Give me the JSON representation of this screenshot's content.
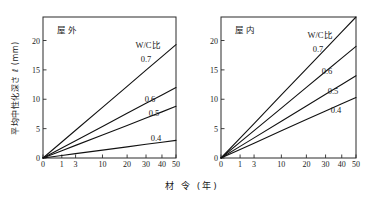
{
  "figure": {
    "axis_title_x": "材 令 (年)",
    "axis_title_y": "平均中性化深さ ℓ (mm)",
    "legend_title": "W/C比"
  },
  "chart_data": [
    {
      "type": "line",
      "title": "屋外",
      "xlabel": "材 令 (年)",
      "ylabel": "平均中性化深さ ℓ (mm)",
      "x_scale": "sqrt",
      "xlim": [
        0,
        50
      ],
      "ylim": [
        0,
        24
      ],
      "xticks": [
        0,
        1,
        3,
        10,
        20,
        30,
        40,
        50
      ],
      "xticklabels": [
        "0",
        "1",
        "3",
        "10",
        "20",
        "30",
        "40",
        "50"
      ],
      "yticks": [
        0,
        5,
        10,
        15,
        20
      ],
      "yticklabels": [
        "0",
        "5",
        "10",
        "15",
        "20"
      ],
      "grid": false,
      "legend_title": "W/C比",
      "legend_position": "inline-right",
      "series": [
        {
          "name": "0.7",
          "label": "0.7",
          "values": [
            {
              "x": 0,
              "y": 0
            },
            {
              "x": 1,
              "y": 2.73
            },
            {
              "x": 3,
              "y": 4.73
            },
            {
              "x": 10,
              "y": 8.63
            },
            {
              "x": 20,
              "y": 12.2
            },
            {
              "x": 30,
              "y": 14.95
            },
            {
              "x": 40,
              "y": 17.26
            },
            {
              "x": 50,
              "y": 19.3
            }
          ]
        },
        {
          "name": "0.6",
          "label": "0.6",
          "values": [
            {
              "x": 0,
              "y": 0
            },
            {
              "x": 1,
              "y": 1.7
            },
            {
              "x": 3,
              "y": 2.94
            },
            {
              "x": 10,
              "y": 5.37
            },
            {
              "x": 20,
              "y": 7.6
            },
            {
              "x": 30,
              "y": 9.3
            },
            {
              "x": 40,
              "y": 10.74
            },
            {
              "x": 50,
              "y": 12.0
            }
          ]
        },
        {
          "name": "0.5",
          "label": "0.5",
          "values": [
            {
              "x": 0,
              "y": 0
            },
            {
              "x": 1,
              "y": 1.24
            },
            {
              "x": 3,
              "y": 2.15
            },
            {
              "x": 10,
              "y": 3.93
            },
            {
              "x": 20,
              "y": 5.55
            },
            {
              "x": 30,
              "y": 6.8
            },
            {
              "x": 40,
              "y": 7.85
            },
            {
              "x": 50,
              "y": 8.8
            }
          ]
        },
        {
          "name": "0.4",
          "label": "0.4",
          "values": [
            {
              "x": 0,
              "y": 0
            },
            {
              "x": 1,
              "y": 0.42
            },
            {
              "x": 3,
              "y": 0.74
            },
            {
              "x": 10,
              "y": 1.34
            },
            {
              "x": 20,
              "y": 1.9
            },
            {
              "x": 30,
              "y": 2.33
            },
            {
              "x": 40,
              "y": 2.69
            },
            {
              "x": 50,
              "y": 3.0
            }
          ]
        }
      ]
    },
    {
      "type": "line",
      "title": "屋内",
      "xlabel": "材 令 (年)",
      "ylabel": "平均中性化深さ ℓ (mm)",
      "x_scale": "sqrt",
      "xlim": [
        0,
        50
      ],
      "ylim": [
        0,
        24
      ],
      "xticks": [
        0,
        1,
        3,
        10,
        20,
        30,
        40,
        50
      ],
      "xticklabels": [
        "0",
        "1",
        "3",
        "10",
        "20",
        "30",
        "40",
        "50"
      ],
      "yticks": [
        0,
        5,
        10,
        15,
        20
      ],
      "yticklabels": [
        "0",
        "5",
        "10",
        "15",
        "20"
      ],
      "grid": false,
      "legend_title": "W/C比",
      "legend_position": "inline-right",
      "series": [
        {
          "name": "0.7",
          "label": "0.7",
          "values": [
            {
              "x": 0,
              "y": 0
            },
            {
              "x": 1,
              "y": 3.39
            },
            {
              "x": 3,
              "y": 5.87
            },
            {
              "x": 10,
              "y": 10.73
            },
            {
              "x": 20,
              "y": 15.17
            },
            {
              "x": 30,
              "y": 18.58
            },
            {
              "x": 40,
              "y": 21.46
            },
            {
              "x": 50,
              "y": 24.0
            }
          ]
        },
        {
          "name": "0.6",
          "label": "0.6",
          "values": [
            {
              "x": 0,
              "y": 0
            },
            {
              "x": 1,
              "y": 2.69
            },
            {
              "x": 3,
              "y": 4.65
            },
            {
              "x": 10,
              "y": 8.5
            },
            {
              "x": 20,
              "y": 12.02
            },
            {
              "x": 30,
              "y": 14.72
            },
            {
              "x": 40,
              "y": 17.0
            },
            {
              "x": 50,
              "y": 19.0
            }
          ]
        },
        {
          "name": "0.5",
          "label": "0.5",
          "values": [
            {
              "x": 0,
              "y": 0
            },
            {
              "x": 1,
              "y": 1.98
            },
            {
              "x": 3,
              "y": 3.43
            },
            {
              "x": 10,
              "y": 6.26
            },
            {
              "x": 20,
              "y": 8.85
            },
            {
              "x": 30,
              "y": 10.84
            },
            {
              "x": 40,
              "y": 12.52
            },
            {
              "x": 50,
              "y": 14.0
            }
          ]
        },
        {
          "name": "0.4",
          "label": "0.4",
          "values": [
            {
              "x": 0,
              "y": 0
            },
            {
              "x": 1,
              "y": 1.46
            },
            {
              "x": 3,
              "y": 2.53
            },
            {
              "x": 10,
              "y": 4.62
            },
            {
              "x": 20,
              "y": 6.54
            },
            {
              "x": 30,
              "y": 8.0
            },
            {
              "x": 40,
              "y": 9.24
            },
            {
              "x": 50,
              "y": 10.3
            }
          ]
        }
      ]
    }
  ]
}
